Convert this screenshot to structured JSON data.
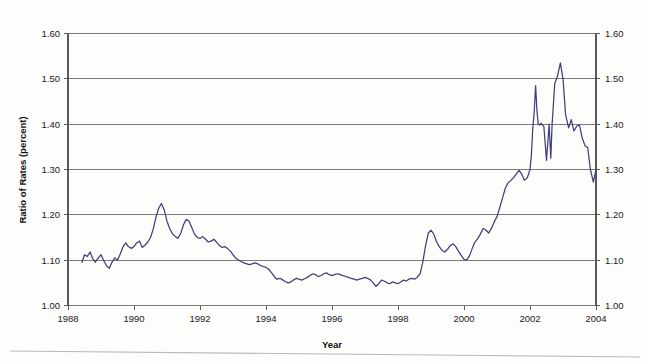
{
  "chart_data": {
    "type": "line",
    "title": "",
    "xlabel": "Year",
    "ylabel": "Ratio of Rates (percent)",
    "xlim": [
      1988,
      2004
    ],
    "ylim": [
      1.0,
      1.6
    ],
    "grid": true,
    "legend": "none",
    "x_ticks": [
      "1988",
      "1990",
      "1992",
      "1994",
      "1996",
      "1998",
      "2000",
      "2002",
      "2004"
    ],
    "x_tick_values": [
      1988,
      1990,
      1992,
      1994,
      1996,
      1998,
      2000,
      2002,
      2004
    ],
    "y_ticks": [
      "1.00",
      "1.10",
      "1.20",
      "1.30",
      "1.40",
      "1.50",
      "1.60"
    ],
    "y_tick_values": [
      1.0,
      1.1,
      1.2,
      1.3,
      1.4,
      1.5,
      1.6
    ],
    "y_ticks_right": [
      "1.00",
      "1.10",
      "1.20",
      "1.30",
      "1.40",
      "1.50",
      "1.60"
    ],
    "series": [
      {
        "name": "Ratio of Rates",
        "color": "#3f3f7d",
        "x": [
          1988.42,
          1988.5,
          1988.58,
          1988.67,
          1988.75,
          1988.83,
          1988.92,
          1989.0,
          1989.08,
          1989.17,
          1989.25,
          1989.33,
          1989.42,
          1989.5,
          1989.58,
          1989.67,
          1989.75,
          1989.83,
          1989.92,
          1990.0,
          1990.08,
          1990.17,
          1990.25,
          1990.33,
          1990.42,
          1990.5,
          1990.58,
          1990.67,
          1990.75,
          1990.83,
          1990.92,
          1991.0,
          1991.08,
          1991.17,
          1991.25,
          1991.33,
          1991.42,
          1991.5,
          1991.58,
          1991.67,
          1991.75,
          1991.83,
          1991.92,
          1992.0,
          1992.08,
          1992.17,
          1992.25,
          1992.33,
          1992.42,
          1992.5,
          1992.58,
          1992.67,
          1992.75,
          1992.83,
          1992.92,
          1993.0,
          1993.08,
          1993.17,
          1993.25,
          1993.33,
          1993.42,
          1993.5,
          1993.58,
          1993.67,
          1993.75,
          1993.83,
          1993.92,
          1994.0,
          1994.08,
          1994.17,
          1994.25,
          1994.33,
          1994.42,
          1994.5,
          1994.58,
          1994.67,
          1994.75,
          1994.83,
          1994.92,
          1995.0,
          1995.08,
          1995.17,
          1995.25,
          1995.33,
          1995.42,
          1995.5,
          1995.58,
          1995.67,
          1995.75,
          1995.83,
          1995.92,
          1996.0,
          1996.08,
          1996.17,
          1996.25,
          1996.33,
          1996.42,
          1996.5,
          1996.58,
          1996.67,
          1996.75,
          1996.83,
          1996.92,
          1997.0,
          1997.08,
          1997.17,
          1997.25,
          1997.33,
          1997.42,
          1997.5,
          1997.58,
          1997.67,
          1997.75,
          1997.83,
          1997.92,
          1998.0,
          1998.08,
          1998.17,
          1998.25,
          1998.33,
          1998.42,
          1998.5,
          1998.58,
          1998.67,
          1998.75,
          1998.83,
          1998.92,
          1999.0,
          1999.08,
          1999.17,
          1999.25,
          1999.33,
          1999.42,
          1999.5,
          1999.58,
          1999.67,
          1999.75,
          1999.83,
          1999.92,
          2000.0,
          2000.08,
          2000.17,
          2000.25,
          2000.33,
          2000.42,
          2000.5,
          2000.58,
          2000.67,
          2000.75,
          2000.83,
          2000.92,
          2001.0,
          2001.08,
          2001.17,
          2001.25,
          2001.33,
          2001.42,
          2001.5,
          2001.58,
          2001.67,
          2001.75,
          2001.83,
          2001.92,
          2002.0,
          2002.04,
          2002.08,
          2002.13,
          2002.17,
          2002.21,
          2002.25,
          2002.29,
          2002.33,
          2002.42,
          2002.5,
          2002.58,
          2002.63,
          2002.67,
          2002.75,
          2002.83,
          2002.92,
          2003.0,
          2003.08,
          2003.17,
          2003.25,
          2003.33,
          2003.42,
          2003.5,
          2003.58,
          2003.67,
          2003.75,
          2003.83,
          2003.92,
          2004.0
        ],
        "y": [
          1.095,
          1.112,
          1.108,
          1.118,
          1.103,
          1.096,
          1.105,
          1.112,
          1.1,
          1.087,
          1.082,
          1.095,
          1.105,
          1.1,
          1.113,
          1.13,
          1.138,
          1.13,
          1.126,
          1.13,
          1.138,
          1.142,
          1.128,
          1.133,
          1.14,
          1.15,
          1.168,
          1.196,
          1.215,
          1.225,
          1.21,
          1.186,
          1.17,
          1.158,
          1.152,
          1.148,
          1.16,
          1.178,
          1.19,
          1.186,
          1.172,
          1.158,
          1.15,
          1.148,
          1.152,
          1.146,
          1.14,
          1.142,
          1.146,
          1.14,
          1.133,
          1.128,
          1.13,
          1.126,
          1.12,
          1.112,
          1.105,
          1.1,
          1.097,
          1.094,
          1.092,
          1.09,
          1.092,
          1.094,
          1.092,
          1.088,
          1.086,
          1.084,
          1.08,
          1.072,
          1.064,
          1.058,
          1.06,
          1.057,
          1.053,
          1.05,
          1.052,
          1.056,
          1.06,
          1.058,
          1.056,
          1.059,
          1.062,
          1.066,
          1.07,
          1.068,
          1.064,
          1.066,
          1.07,
          1.072,
          1.068,
          1.066,
          1.068,
          1.07,
          1.068,
          1.066,
          1.064,
          1.062,
          1.06,
          1.058,
          1.056,
          1.058,
          1.06,
          1.062,
          1.06,
          1.056,
          1.05,
          1.042,
          1.048,
          1.056,
          1.054,
          1.05,
          1.048,
          1.052,
          1.05,
          1.048,
          1.052,
          1.056,
          1.054,
          1.058,
          1.06,
          1.058,
          1.062,
          1.07,
          1.095,
          1.13,
          1.16,
          1.166,
          1.158,
          1.14,
          1.13,
          1.122,
          1.118,
          1.124,
          1.132,
          1.136,
          1.13,
          1.12,
          1.11,
          1.102,
          1.1,
          1.11,
          1.126,
          1.14,
          1.148,
          1.158,
          1.17,
          1.166,
          1.16,
          1.17,
          1.185,
          1.196,
          1.215,
          1.238,
          1.258,
          1.27,
          1.276,
          1.282,
          1.29,
          1.298,
          1.29,
          1.276,
          1.282,
          1.3,
          1.33,
          1.385,
          1.43,
          1.485,
          1.43,
          1.4,
          1.398,
          1.402,
          1.395,
          1.32,
          1.4,
          1.325,
          1.4,
          1.49,
          1.505,
          1.535,
          1.5,
          1.42,
          1.392,
          1.41,
          1.385,
          1.396,
          1.398,
          1.37,
          1.352,
          1.348,
          1.3,
          1.272,
          1.3
        ]
      }
    ]
  },
  "axis": {
    "x_title": "Year",
    "y_title": "Ratio of Rates (percent)"
  }
}
